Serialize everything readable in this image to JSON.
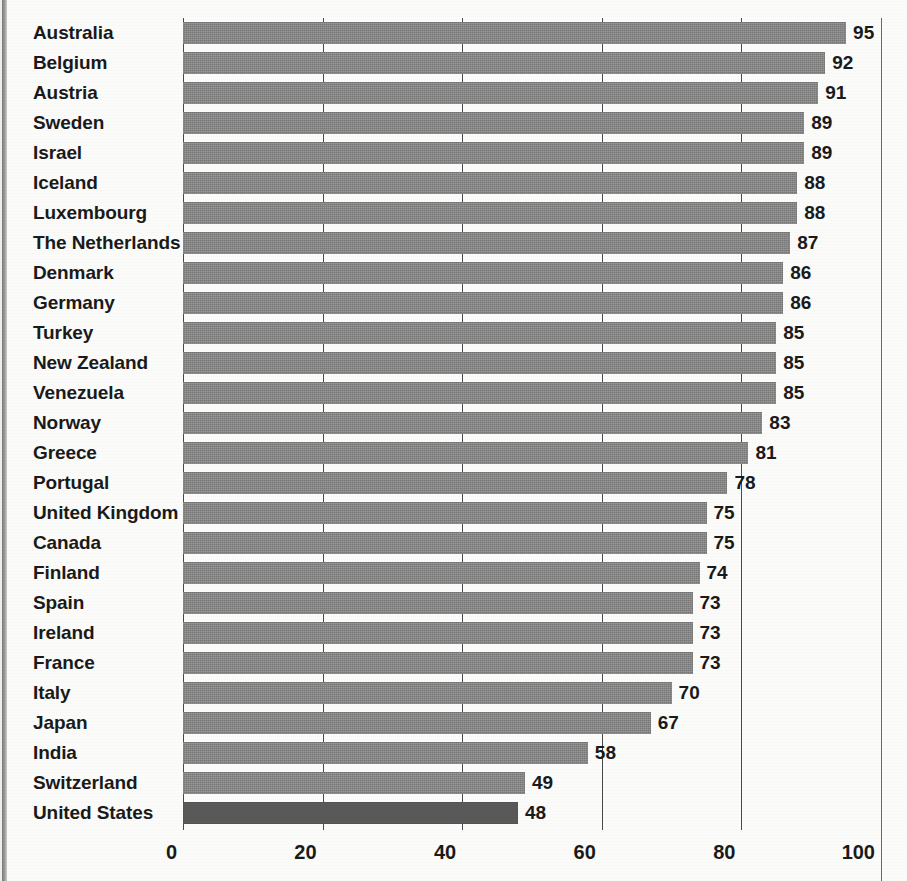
{
  "chart_data": {
    "type": "bar",
    "orientation": "horizontal",
    "title": "",
    "subtitle": "",
    "xlabel": "",
    "ylabel": "",
    "xlim": [
      0,
      100
    ],
    "xticks": [
      0,
      20,
      40,
      60,
      80,
      100
    ],
    "grid": true,
    "gridlines": "vertical",
    "legend": "none",
    "sorted": "descending",
    "bar_color": "#838383",
    "highlight_color": "#595959",
    "highlight_category": "United States",
    "value_labels": true,
    "categories": [
      "Australia",
      "Belgium",
      "Austria",
      "Sweden",
      "Israel",
      "Iceland",
      "Luxembourg",
      "The Netherlands",
      "Denmark",
      "Germany",
      "Turkey",
      "New Zealand",
      "Venezuela",
      "Norway",
      "Greece",
      "Portugal",
      "United Kingdom",
      "Canada",
      "Finland",
      "Spain",
      "Ireland",
      "France",
      "Italy",
      "Japan",
      "India",
      "Switzerland",
      "United States"
    ],
    "values": [
      95,
      92,
      91,
      89,
      89,
      88,
      88,
      87,
      86,
      86,
      85,
      85,
      85,
      83,
      81,
      78,
      75,
      75,
      74,
      73,
      73,
      73,
      70,
      67,
      58,
      49,
      48
    ]
  },
  "axis": {
    "tick_labels": [
      "0",
      "20",
      "40",
      "60",
      "80",
      "100"
    ]
  }
}
